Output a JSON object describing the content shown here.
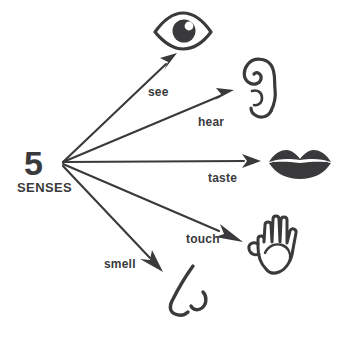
{
  "diagram": {
    "title": "5 SENSES",
    "hub": {
      "number": "5",
      "word": "SENSES"
    },
    "ink_color": "#3a3a3c",
    "background_color": "#ffffff",
    "edges": [
      {
        "label": "see",
        "icon": "eye-icon",
        "direction": "up-right"
      },
      {
        "label": "hear",
        "icon": "ear-icon",
        "direction": "right-up"
      },
      {
        "label": "taste",
        "icon": "lips-icon",
        "direction": "right"
      },
      {
        "label": "touch",
        "icon": "hand-icon",
        "direction": "right-down"
      },
      {
        "label": "smell",
        "icon": "nose-icon",
        "direction": "down-right"
      }
    ]
  }
}
